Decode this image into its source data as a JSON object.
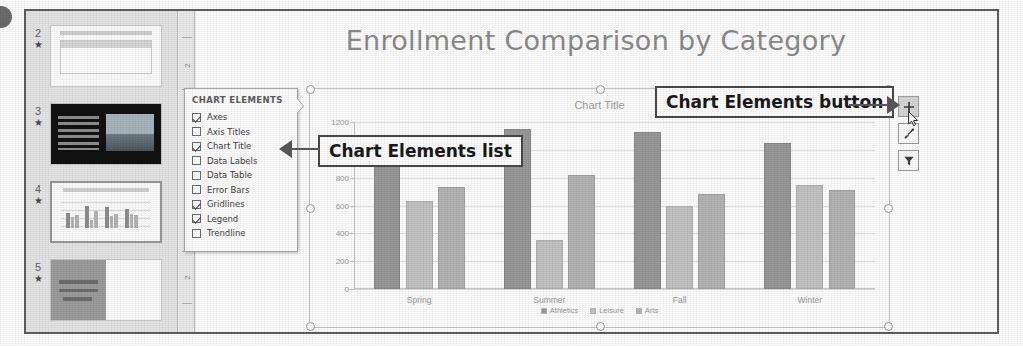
{
  "figure": {
    "bullet_marker": "callout-dot"
  },
  "thumbnails": {
    "slides": [
      {
        "number": "2",
        "star": "★",
        "kind": "table-slide",
        "selected": false
      },
      {
        "number": "3",
        "star": "★",
        "kind": "dark-photo-slide",
        "selected": false
      },
      {
        "number": "4",
        "star": "★",
        "kind": "chart-slide",
        "selected": true
      },
      {
        "number": "5",
        "star": "★",
        "kind": "text-half-slide",
        "selected": false
      }
    ]
  },
  "ruler": {
    "labels": [
      "2",
      "2"
    ]
  },
  "slide": {
    "title": "Enrollment Comparison by Category",
    "chart_title_placeholder": "Chart Title"
  },
  "chart_elements_panel": {
    "header": "CHART ELEMENTS",
    "items": [
      {
        "label": "Axes",
        "checked": true
      },
      {
        "label": "Axis Titles",
        "checked": false
      },
      {
        "label": "Chart Title",
        "checked": true
      },
      {
        "label": "Data Labels",
        "checked": false
      },
      {
        "label": "Data Table",
        "checked": false
      },
      {
        "label": "Error Bars",
        "checked": false
      },
      {
        "label": "Gridlines",
        "checked": true
      },
      {
        "label": "Legend",
        "checked": true
      },
      {
        "label": "Trendline",
        "checked": false
      }
    ]
  },
  "callouts": {
    "list": "Chart Elements list",
    "button": "Chart Elements button"
  },
  "side_buttons": [
    {
      "name": "chart-elements",
      "glyph": "plus",
      "active": true
    },
    {
      "name": "chart-styles",
      "glyph": "brush",
      "active": false
    },
    {
      "name": "chart-filters",
      "glyph": "funnel",
      "active": false
    }
  ],
  "colors": {
    "series_athletics": "#9a9a9a",
    "series_leisure": "#c4c4c4",
    "series_arts": "#b5b5b5",
    "gridline": "#e2e2e2",
    "axis_text": "#9a9a9a",
    "slide_title": "#8c8c8c",
    "callout_border": "#4a4a4a"
  },
  "chart_data": {
    "type": "bar",
    "title": "Chart Title",
    "xlabel": "",
    "ylabel": "",
    "ylim": [
      0,
      1200
    ],
    "yticks": [
      0,
      200,
      400,
      600,
      800,
      1000,
      1200
    ],
    "ytick_labels": [
      "0",
      "200",
      "400",
      "600",
      "800",
      "1000",
      "1200"
    ],
    "grid": true,
    "legend_position": "bottom",
    "categories": [
      "Spring",
      "Summer",
      "Fall",
      "Winter"
    ],
    "series": [
      {
        "name": "Athletics",
        "color": "#9a9a9a",
        "values": [
          890,
          1150,
          1130,
          1050
        ]
      },
      {
        "name": "Leisure",
        "color": "#c4c4c4",
        "values": [
          630,
          350,
          600,
          750
        ]
      },
      {
        "name": "Arts",
        "color": "#b5b5b5",
        "values": [
          735,
          820,
          680,
          710
        ]
      }
    ]
  }
}
